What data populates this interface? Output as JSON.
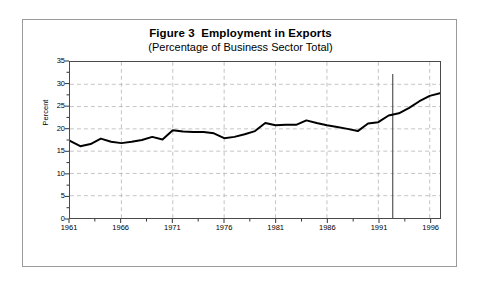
{
  "figure": {
    "title": "Figure 3  Employment in Exports",
    "subtitle": "(Percentage of Business Sector Total)"
  },
  "chart_data": {
    "type": "line",
    "title": "Figure 3  Employment in Exports",
    "subtitle": "(Percentage of Business Sector Total)",
    "xlabel": "",
    "ylabel": "Percent",
    "xlim": [
      1961,
      1997
    ],
    "ylim": [
      0,
      35
    ],
    "y_ticks": [
      0,
      5,
      10,
      15,
      20,
      25,
      30,
      35
    ],
    "y_tick_labels": [
      "0",
      "5",
      "10",
      "15",
      "20",
      "25",
      "30",
      "35"
    ],
    "y_minor_ticks": [
      2.5,
      7.5,
      12.5,
      17.5,
      22.5,
      27.5,
      32.5
    ],
    "x_ticks": [
      1961,
      1966,
      1971,
      1976,
      1981,
      1986,
      1991,
      1996
    ],
    "x_tick_labels": [
      "1961",
      "1966",
      "1971",
      "1976",
      "1981",
      "1986",
      "1991",
      "1996"
    ],
    "x_minor_ticks": [
      1963.5,
      1968.5,
      1973.5,
      1978.5,
      1983.5,
      1988.5,
      1993.5
    ],
    "grid": true,
    "grid_style": "dashed",
    "grid_color": "#b4b4b4",
    "line_color": "#000000",
    "line_width": 2,
    "legend": null,
    "annotations": [
      {
        "name": "vertical-reference-line",
        "type": "vline",
        "x": 1992.4,
        "y_from": 0,
        "y_to": 32.3,
        "color": "#555555"
      }
    ],
    "x": [
      1961,
      1962,
      1963,
      1964,
      1965,
      1966,
      1967,
      1968,
      1969,
      1970,
      1971,
      1972,
      1973,
      1974,
      1975,
      1976,
      1977,
      1978,
      1979,
      1980,
      1981,
      1982,
      1983,
      1984,
      1985,
      1986,
      1987,
      1988,
      1989,
      1990,
      1991,
      1992,
      1993,
      1994,
      1995,
      1996,
      1997
    ],
    "series": [
      {
        "name": "Employment in Exports",
        "values": [
          17.3,
          16.1,
          16.6,
          17.8,
          17.1,
          16.8,
          17.1,
          17.5,
          18.2,
          17.6,
          19.7,
          19.4,
          19.3,
          19.3,
          19.0,
          17.9,
          18.2,
          18.8,
          19.5,
          21.3,
          20.8,
          20.9,
          20.9,
          21.9,
          21.3,
          20.8,
          20.4,
          20.0,
          19.5,
          21.2,
          21.5,
          23.0,
          23.5,
          24.7,
          26.2,
          27.4,
          28.0
        ]
      }
    ]
  }
}
